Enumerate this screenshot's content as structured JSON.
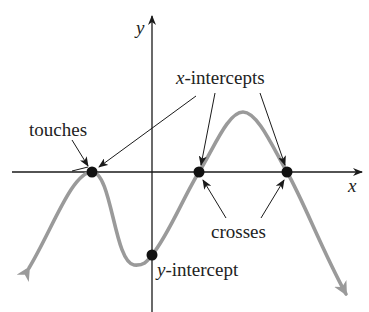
{
  "diagram": {
    "axes": {
      "x_label": "x",
      "y_label": "y",
      "color": "#1a1a1a"
    },
    "curve": {
      "color": "#9a9a9a",
      "description": "polynomial graph falling to -infinity at both ends"
    },
    "points": [
      {
        "name": "touch-point",
        "x": 92,
        "y": 172,
        "kind": "x-intercept (touches)"
      },
      {
        "name": "cross-point-1",
        "x": 199,
        "y": 172,
        "kind": "x-intercept (crosses)"
      },
      {
        "name": "cross-point-2",
        "x": 287,
        "y": 172,
        "kind": "x-intercept (crosses)"
      },
      {
        "name": "y-intercept-point",
        "x": 152,
        "y": 255,
        "kind": "y-intercept"
      }
    ],
    "labels": {
      "touches": "touches",
      "x_intercepts_var": "x",
      "x_intercepts_rest": "-intercepts",
      "crosses": "crosses",
      "y_intercept_var": "y",
      "y_intercept_rest": "-intercept"
    },
    "point_color": "#111111"
  }
}
